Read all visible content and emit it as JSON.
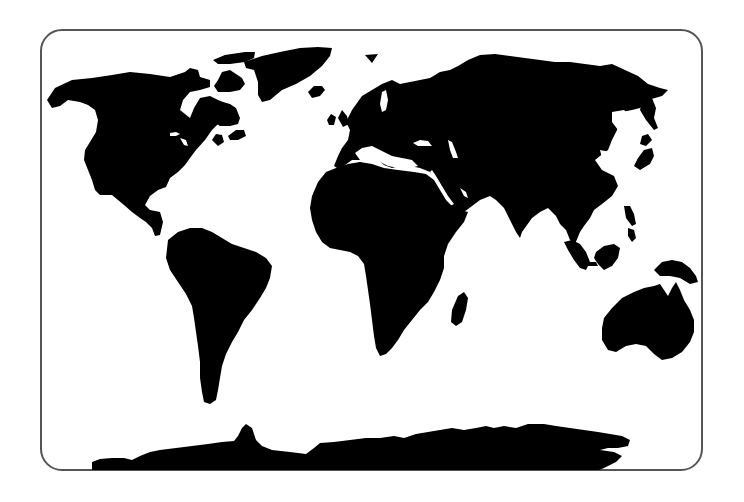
{
  "map": {
    "type": "world-silhouette",
    "projection": "equirectangular-style",
    "colors": {
      "background": "#ffffff",
      "land": "#000000",
      "frame_border": "#555555"
    },
    "frame": {
      "left": 40,
      "top": 29,
      "right": 703,
      "bottom": 471,
      "corner_radius": 22
    },
    "landmasses": [
      {
        "id": "north-america",
        "label": "North America"
      },
      {
        "id": "greenland",
        "label": "Greenland"
      },
      {
        "id": "arctic-islands",
        "label": "Arctic Islands"
      },
      {
        "id": "south-america",
        "label": "South America"
      },
      {
        "id": "europe-asia",
        "label": "Eurasia"
      },
      {
        "id": "africa",
        "label": "Africa"
      },
      {
        "id": "madagascar",
        "label": "Madagascar"
      },
      {
        "id": "british-isles",
        "label": "British Isles"
      },
      {
        "id": "iceland",
        "label": "Iceland"
      },
      {
        "id": "japan",
        "label": "Japan"
      },
      {
        "id": "southeast-asia-islands",
        "label": "Southeast Asian Islands"
      },
      {
        "id": "new-guinea",
        "label": "New Guinea"
      },
      {
        "id": "australia",
        "label": "Australia"
      },
      {
        "id": "antarctica",
        "label": "Antarctica"
      }
    ]
  }
}
